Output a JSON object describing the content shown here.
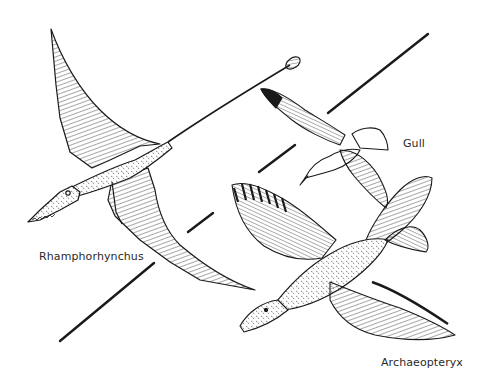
{
  "figure": {
    "ink_color": "#1a1a1a",
    "background_color": "#ffffff"
  },
  "labels": {
    "rhamphorhynchus": "Rhamphorhynchus",
    "gull": "Gull",
    "archaeopteryx": "Archaeopteryx"
  },
  "animals": [
    {
      "name": "Rhamphorhynchus",
      "kind": "pterosaur",
      "icon": "pterosaur-illustration"
    },
    {
      "name": "Gull",
      "kind": "modern bird",
      "icon": "gull-illustration"
    },
    {
      "name": "Archaeopteryx",
      "kind": "early bird",
      "icon": "archaeopteryx-illustration"
    }
  ]
}
